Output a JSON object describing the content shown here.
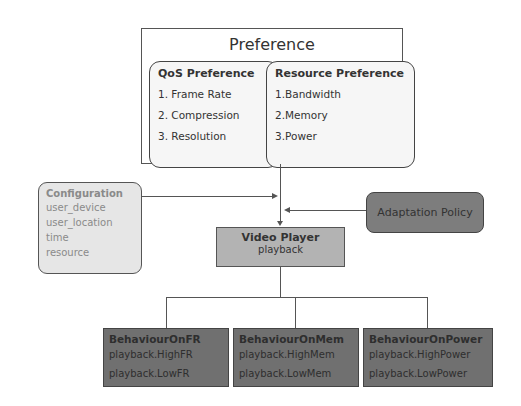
{
  "preference": {
    "title": "Preference",
    "qos": {
      "title": "QoS Preference",
      "items": [
        "1. Frame Rate",
        "2. Compression",
        "3. Resolution"
      ]
    },
    "resource": {
      "title": "Resource Preference",
      "items": [
        "1.Bandwidth",
        "2.Memory",
        "3.Power"
      ]
    }
  },
  "configuration": {
    "title": "Configuration",
    "items": [
      "user_device",
      "user_location",
      "time",
      "resource"
    ]
  },
  "adaptation_policy": {
    "label": "Adaptation Policy"
  },
  "video_player": {
    "title": "Video Player",
    "subtitle": "playback"
  },
  "behaviours": [
    {
      "title": "BehaviourOnFR",
      "items": [
        "playback.HighFR",
        "playback.LowFR"
      ]
    },
    {
      "title": "BehaviourOnMem",
      "items": [
        "playback.HighMem",
        "playback.LowMem"
      ]
    },
    {
      "title": "BehaviourOnPower",
      "items": [
        "playback.HighPower",
        "playback.LowPower"
      ]
    }
  ],
  "colors": {
    "config_fill": "#e6e6e6",
    "policy_fill": "#7d7d7d",
    "player_fill": "#b3b3b3",
    "behaviour_fill": "#707070"
  }
}
